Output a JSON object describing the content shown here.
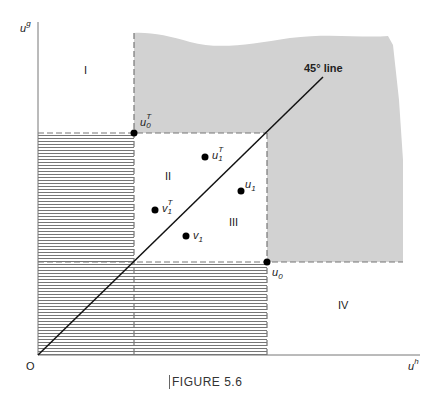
{
  "axes": {
    "y_label_base": "u",
    "y_label_sup": "g",
    "x_label_base": "u",
    "x_label_sup": "h",
    "origin_label": "O"
  },
  "regions": {
    "I": "I",
    "II": "II",
    "III": "III",
    "IV": "IV"
  },
  "line_label": "45° line",
  "points": {
    "u0T": {
      "base": "u",
      "sup": "T",
      "sub": "0"
    },
    "u0": {
      "base": "u",
      "sub": "0"
    },
    "u1T": {
      "base": "u",
      "sup": "T",
      "sub": "1"
    },
    "u1": {
      "base": "u",
      "sub": "1"
    },
    "v1T": {
      "base": "v",
      "sup": "T",
      "sub": "1"
    },
    "v1": {
      "base": "v",
      "sub": "1"
    }
  },
  "caption": "FIGURE 5.6",
  "colors": {
    "shade": "#d2d2d2",
    "hatch": "#555555",
    "axis": "#777777",
    "line": "#111111"
  }
}
